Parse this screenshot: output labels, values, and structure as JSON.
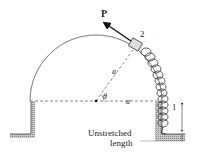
{
  "diagram": {
    "labels": {
      "force": "P",
      "block": "2",
      "radius_slant": "a",
      "radius_horizontal": "a",
      "angle": "θ",
      "dimension": "l",
      "unstretched_line1": "Unstretched",
      "unstretched_line2": "length"
    },
    "colors": {
      "line": "#555555",
      "hatch": "#9a9a9a",
      "block_fill": "#dddddd",
      "arrow": "#111111"
    }
  }
}
